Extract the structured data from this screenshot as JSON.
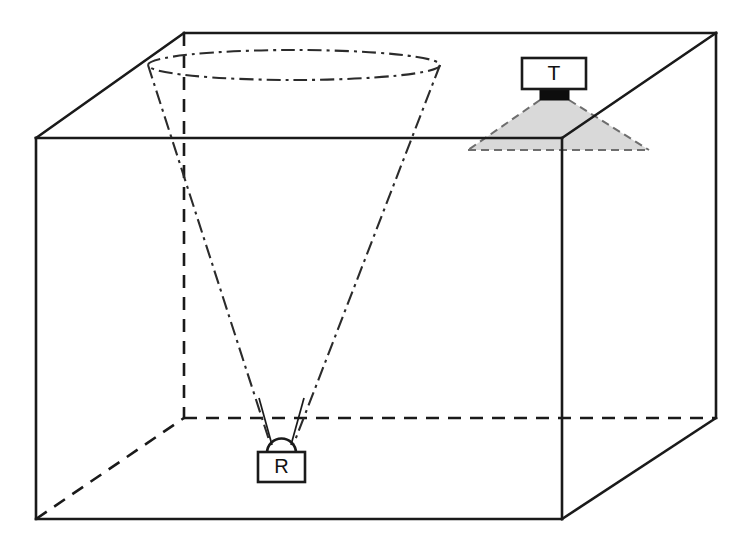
{
  "figure": {
    "type": "technical-line-diagram",
    "canvas": {
      "width": 742,
      "height": 550
    },
    "background_color": "#ffffff"
  },
  "colors": {
    "line": "#1a1a1a",
    "hidden_line": "#1a1a1a",
    "cone_line": "#2b2b2b",
    "beam_fill": "#d9d9d9",
    "beam_edge": "#6e6e6e",
    "transducer_face": "#0d0d0d",
    "device_fill": "#ffffff",
    "text": "#111111"
  },
  "devices": {
    "transmitter": {
      "label": "T",
      "name": "transmitter",
      "box": {
        "x": 522,
        "y": 58,
        "width": 64,
        "height": 31
      },
      "face": {
        "x": 540,
        "y": 89,
        "width": 29,
        "height": 11
      },
      "beam": {
        "apex_left_x": 540,
        "apex_right_x": 569,
        "apex_y": 100,
        "base_left_x": 468,
        "base_right_x": 649,
        "base_y": 150
      }
    },
    "receiver": {
      "label": "R",
      "name": "receiver",
      "box": {
        "x": 258,
        "y": 452,
        "width": 47,
        "height": 30
      },
      "dome": {
        "cx": 281,
        "cy": 452,
        "r": 14
      },
      "apex": {
        "x": 281,
        "y": 440
      }
    }
  },
  "tank": {
    "name": "rectangular-tank",
    "front_face": {
      "top_left": {
        "x": 36,
        "y": 138
      },
      "top_right": {
        "x": 562,
        "y": 138
      },
      "bottom_right": {
        "x": 562,
        "y": 519
      },
      "bottom_left": {
        "x": 36,
        "y": 519
      }
    },
    "back_face": {
      "top_left": {
        "x": 184,
        "y": 33
      },
      "top_right": {
        "x": 716,
        "y": 33
      },
      "bottom_right": {
        "x": 716,
        "y": 418
      },
      "bottom_left": {
        "x": 184,
        "y": 418
      }
    },
    "visible_edges": [
      "front-top",
      "front-left",
      "front-bottom",
      "front-right",
      "top-left-diagonal",
      "top-back",
      "top-right-diagonal",
      "right-back-vertical",
      "bottom-right-diagonal"
    ],
    "hidden_edges": [
      "back-left-vertical",
      "back-bottom",
      "bottom-left-diagonal"
    ]
  },
  "beam_cone": {
    "name": "receiver-acceptance-cone",
    "line_style": "dash-dot",
    "top_ellipse": {
      "cx": 294,
      "cy": 65,
      "rx": 146,
      "ry": 15
    },
    "apex": {
      "x": 281,
      "y": 443
    },
    "left_edge": {
      "x1": 148,
      "y1": 65,
      "x2": 270,
      "y2": 443
    },
    "right_edge": {
      "x1": 440,
      "y1": 65,
      "x2": 294,
      "y2": 443
    }
  },
  "rays": [
    {
      "name": "ray-left",
      "x1": 260,
      "y1": 400,
      "x2": 272,
      "y2": 444
    },
    {
      "name": "ray-right",
      "x1": 303,
      "y1": 400,
      "x2": 290,
      "y2": 444
    }
  ]
}
